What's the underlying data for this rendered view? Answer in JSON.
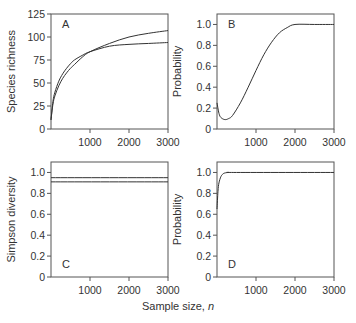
{
  "figure": {
    "xlabel_prefix": "Sample size, ",
    "xlabel_var": "n"
  },
  "chart_data": [
    {
      "panel": "A",
      "type": "line",
      "ylabel": "Species richness",
      "xlabel": "Sample size, n",
      "xlim": [
        0,
        3000
      ],
      "ylim": [
        0,
        125
      ],
      "xticks": [
        1000,
        2000,
        3000
      ],
      "yticks": [
        0,
        25,
        50,
        75,
        100,
        125
      ],
      "grid": false,
      "series": [
        {
          "name": "curve 1",
          "x": [
            0,
            50,
            100,
            200,
            300,
            400,
            500,
            600,
            800,
            1000,
            1500,
            2000,
            2500,
            3000
          ],
          "y": [
            10,
            30,
            40,
            52,
            60,
            66,
            71,
            75,
            80,
            84,
            90,
            92,
            93,
            94
          ]
        },
        {
          "name": "curve 2",
          "x": [
            0,
            50,
            100,
            200,
            300,
            400,
            500,
            600,
            800,
            1000,
            1500,
            2000,
            2500,
            3000
          ],
          "y": [
            10,
            27,
            36,
            47,
            55,
            61,
            66,
            70,
            78,
            84,
            93,
            100,
            104,
            107
          ]
        }
      ]
    },
    {
      "panel": "B",
      "type": "line",
      "ylabel": "Probability",
      "xlabel": "Sample size, n",
      "xlim": [
        0,
        3000
      ],
      "ylim": [
        0,
        1.1
      ],
      "xticks": [
        1000,
        2000,
        3000
      ],
      "yticks": [
        0,
        0.2,
        0.4,
        0.6,
        0.8,
        1.0
      ],
      "ytick_labels": [
        "0",
        "0.2",
        "0.4",
        "0.6",
        "0.8",
        "1.0"
      ],
      "grid": false,
      "series": [
        {
          "name": "probability",
          "x": [
            0,
            50,
            100,
            200,
            300,
            400,
            600,
            800,
            1000,
            1200,
            1400,
            1600,
            1800,
            2000,
            2500,
            3000
          ],
          "y": [
            0.25,
            0.15,
            0.11,
            0.09,
            0.1,
            0.13,
            0.25,
            0.4,
            0.56,
            0.71,
            0.83,
            0.92,
            0.97,
            1.0,
            1.0,
            1.0
          ]
        }
      ]
    },
    {
      "panel": "C",
      "type": "line",
      "ylabel": "Simpson diversity",
      "xlabel": "Sample size, n",
      "xlim": [
        0,
        3000
      ],
      "ylim": [
        0,
        1.1
      ],
      "xticks": [
        1000,
        2000,
        3000
      ],
      "yticks": [
        0,
        0.2,
        0.4,
        0.6,
        0.8,
        1.0
      ],
      "ytick_labels": [
        "0",
        "0.2",
        "0.4",
        "0.6",
        "0.8",
        "1.0"
      ],
      "grid": false,
      "series": [
        {
          "name": "curve 1",
          "x": [
            0,
            3000
          ],
          "y": [
            0.95,
            0.95
          ]
        },
        {
          "name": "curve 2",
          "x": [
            0,
            3000
          ],
          "y": [
            0.91,
            0.91
          ]
        }
      ]
    },
    {
      "panel": "D",
      "type": "line",
      "ylabel": "Probability",
      "xlabel": "Sample size, n",
      "xlim": [
        0,
        3000
      ],
      "ylim": [
        0,
        1.1
      ],
      "xticks": [
        1000,
        2000,
        3000
      ],
      "yticks": [
        0,
        0.2,
        0.4,
        0.6,
        0.8,
        1.0
      ],
      "ytick_labels": [
        "0",
        "0.2",
        "0.4",
        "0.6",
        "0.8",
        "1.0"
      ],
      "grid": false,
      "series": [
        {
          "name": "probability",
          "x": [
            0,
            25,
            50,
            100,
            150,
            200,
            300,
            500,
            3000
          ],
          "y": [
            0.65,
            0.82,
            0.9,
            0.96,
            0.985,
            0.995,
            1.0,
            1.0,
            1.0
          ]
        }
      ]
    }
  ]
}
